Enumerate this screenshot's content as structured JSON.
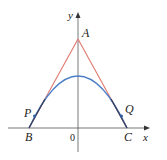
{
  "diagram": {
    "axes": {
      "x_label": "x",
      "y_label": "y",
      "origin_label": "0"
    },
    "points": {
      "A": {
        "label": "A"
      },
      "B": {
        "label": "B"
      },
      "C": {
        "label": "C"
      },
      "P": {
        "label": "P"
      },
      "Q": {
        "label": "Q"
      }
    },
    "curves": {
      "parabola": {
        "name": "parabola",
        "color": "#4a7fc8"
      },
      "tangent_lines": {
        "name": "tangent lines AB and AC",
        "color": "#e0786e"
      }
    },
    "colors": {
      "axis": "#555555",
      "overlap": "#3a3f5c",
      "point": "#2f5fa8"
    }
  }
}
